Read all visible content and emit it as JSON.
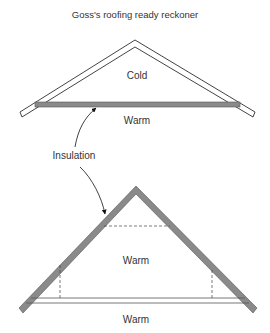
{
  "title": "Goss's roofing ready reckoner",
  "top_diagram": {
    "upper_label": "Cold",
    "lower_label": "Warm"
  },
  "annotation": {
    "label": "Insulation"
  },
  "bottom_diagram": {
    "inner_label": "Warm",
    "lower_label": "Warm"
  },
  "colors": {
    "insulation": "#8a8a8a",
    "outline": "#444444"
  }
}
